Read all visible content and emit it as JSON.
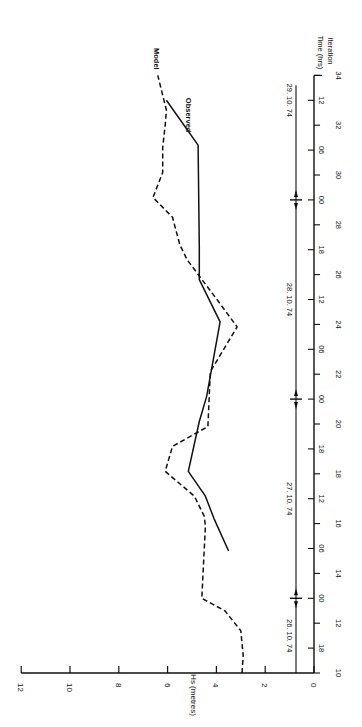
{
  "chart_data": {
    "type": "line",
    "orientation": "rotated 90 degrees (time axis vertical on right, Hs axis horizontal along bottom)",
    "title": "",
    "xlabel": "Time (hrs) / Iteration",
    "ylabel": "Hs (metres)",
    "ylim": [
      0,
      12
    ],
    "y_ticks": [
      0,
      2,
      4,
      6,
      8,
      10,
      12
    ],
    "x_axis": {
      "iteration_range": [
        10,
        34
      ],
      "iteration_ticks": [
        10,
        12,
        14,
        16,
        18,
        20,
        22,
        24,
        26,
        28,
        30,
        32,
        34
      ],
      "time_ticks": [
        {
          "iteration": 11,
          "label": "18"
        },
        {
          "iteration": 13,
          "label": "00"
        },
        {
          "iteration": 15,
          "label": "06"
        },
        {
          "iteration": 17,
          "label": "12"
        },
        {
          "iteration": 19,
          "label": "18"
        },
        {
          "iteration": 21,
          "label": "00"
        },
        {
          "iteration": 23,
          "label": "06"
        },
        {
          "iteration": 25,
          "label": "12"
        },
        {
          "iteration": 27,
          "label": "18"
        },
        {
          "iteration": 29,
          "label": "00"
        },
        {
          "iteration": 31,
          "label": "06"
        },
        {
          "iteration": 33,
          "label": "12"
        }
      ],
      "date_labels": [
        {
          "iteration": 11.5,
          "label": "26. 10. 74"
        },
        {
          "iteration": 17,
          "label": "27. 10. 74"
        },
        {
          "iteration": 25,
          "label": "28. 10. 74"
        },
        {
          "iteration": 33,
          "label": "29. 10. 74"
        }
      ],
      "day_boundaries": [
        13,
        21,
        29
      ],
      "axis_title_time": "Time (hrs)",
      "axis_title_iteration": "Iteration"
    },
    "series": [
      {
        "name": "Model",
        "style": "dashed",
        "points": [
          [
            10,
            2.95
          ],
          [
            10.7,
            2.9
          ],
          [
            11.7,
            3.0
          ],
          [
            12.5,
            3.65
          ],
          [
            13.0,
            4.6
          ],
          [
            15.9,
            4.45
          ],
          [
            16.3,
            4.5
          ],
          [
            17.1,
            4.9
          ],
          [
            18.1,
            6.1
          ],
          [
            19.1,
            5.8
          ],
          [
            19.9,
            4.35
          ],
          [
            22.1,
            4.25
          ],
          [
            23.9,
            3.15
          ],
          [
            24.9,
            3.9
          ],
          [
            26.6,
            5.2
          ],
          [
            27.2,
            5.5
          ],
          [
            28.3,
            5.8
          ],
          [
            29.1,
            6.6
          ],
          [
            30.1,
            6.2
          ],
          [
            31.1,
            6.2
          ],
          [
            32.0,
            6.1
          ],
          [
            32.6,
            6.05
          ],
          [
            34.0,
            6.4
          ]
        ]
      },
      {
        "name": "Observed",
        "style": "solid",
        "points": [
          [
            14.9,
            3.5
          ],
          [
            16.2,
            4.1
          ],
          [
            17.1,
            4.45
          ],
          [
            18.1,
            5.15
          ],
          [
            20.1,
            4.7
          ],
          [
            21.1,
            4.4
          ],
          [
            24.1,
            3.85
          ],
          [
            25.8,
            4.7
          ],
          [
            27.1,
            4.7
          ],
          [
            31.2,
            4.75
          ],
          [
            33.0,
            6.05
          ]
        ]
      }
    ],
    "legend": [
      {
        "name": "Model",
        "style": "dashed",
        "position": "end of dashed curve, top"
      },
      {
        "name": "Observed",
        "style": "solid",
        "position": "end of solid curve, top"
      }
    ],
    "grid": false
  },
  "labels": {
    "hs_axis_title": "Hs (metres)",
    "time_axis_title": "Time (hrs)",
    "iteration_axis_title": "Iteration",
    "legend_model": "Model",
    "legend_observed": "Observed"
  }
}
